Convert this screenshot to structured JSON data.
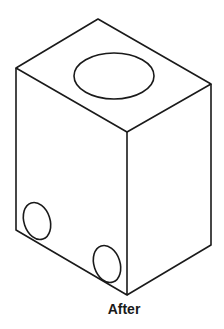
{
  "figure": {
    "caption": "After",
    "stroke_color": "#1a1a1a",
    "background": "#ffffff",
    "object": "isometric block with top cylindrical hole and two holes on left face"
  }
}
